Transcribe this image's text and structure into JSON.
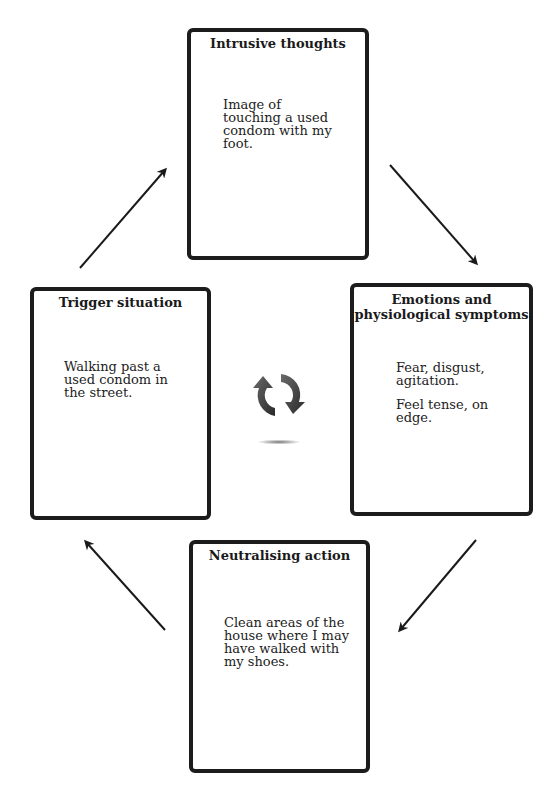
{
  "diagram": {
    "type": "cycle",
    "nodes": [
      {
        "id": "intrusive",
        "title": "Intrusive thoughts",
        "lines": [
          "Image of touching a used condom with my foot."
        ]
      },
      {
        "id": "emotions",
        "title": "Emotions and physiological symptoms",
        "title_lines": [
          "Emotions and",
          "physiological symptoms"
        ],
        "lines": [
          "Fear, disgust, agitation.",
          "Feel tense, on edge."
        ]
      },
      {
        "id": "neutralising",
        "title": "Neutralising action",
        "lines": [
          "Clean areas of the house where I may have walked with my shoes."
        ]
      },
      {
        "id": "trigger",
        "title": "Trigger situation",
        "lines": [
          "Walking past a used condom in the street."
        ]
      }
    ],
    "edges": [
      {
        "from": "trigger",
        "to": "intrusive"
      },
      {
        "from": "intrusive",
        "to": "emotions"
      },
      {
        "from": "emotions",
        "to": "neutralising"
      },
      {
        "from": "neutralising",
        "to": "trigger"
      }
    ],
    "center_icon": "cycle-refresh-icon",
    "colors": {
      "border": "#1c1c1c",
      "arrow": "#1a1a1a",
      "icon": "#3a3a3a"
    }
  }
}
